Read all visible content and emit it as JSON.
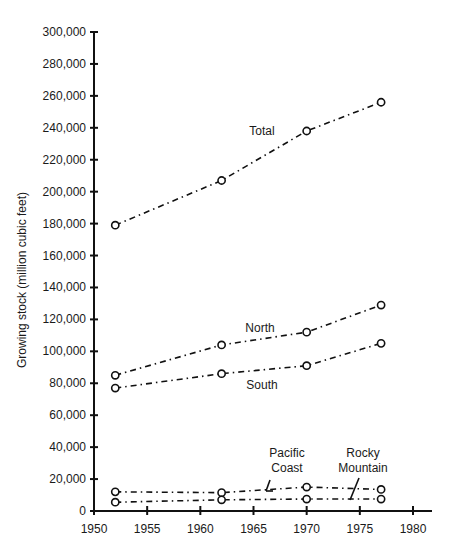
{
  "chart_data": {
    "type": "line",
    "title": "",
    "xlabel": "",
    "ylabel": "Growing stock (million cubic feet)",
    "xlim": [
      1950,
      1980
    ],
    "ylim": [
      0,
      300000
    ],
    "x_ticks": [
      1950,
      1955,
      1960,
      1965,
      1970,
      1975,
      1980
    ],
    "x_tick_labels": [
      "1950",
      "1955",
      "1960",
      "1965",
      "1970",
      "1975",
      "1980"
    ],
    "y_ticks": [
      0,
      20000,
      40000,
      60000,
      80000,
      100000,
      120000,
      140000,
      160000,
      180000,
      200000,
      220000,
      240000,
      260000,
      280000,
      300000
    ],
    "y_tick_labels": [
      "0",
      "20,000",
      "40,000",
      "60,000",
      "80,000",
      "100,000",
      "120,000",
      "140,000",
      "160,000",
      "180,000",
      "200,000",
      "220,000",
      "240,000",
      "260,000",
      "280,000",
      "300,000"
    ],
    "grid": false,
    "legend": "none (direct labels)",
    "x": [
      1952,
      1962,
      1970,
      1977
    ],
    "series": [
      {
        "name": "Total",
        "label": "Total",
        "values": [
          179000,
          207000,
          238000,
          256000
        ]
      },
      {
        "name": "North",
        "label": "North",
        "values": [
          85000,
          104000,
          112000,
          129000
        ]
      },
      {
        "name": "South",
        "label": "South",
        "values": [
          77000,
          86000,
          91000,
          105000
        ]
      },
      {
        "name": "Pacific Coast",
        "label_lines": [
          "Pacific",
          "Coast"
        ],
        "values": [
          12000,
          11500,
          15000,
          13500
        ]
      },
      {
        "name": "Rocky Mountain",
        "label_lines": [
          "Rocky",
          "Mountain"
        ],
        "values": [
          5500,
          7000,
          7500,
          7500
        ]
      }
    ],
    "line_style": "dash-dot",
    "marker": "open-circle",
    "color": "#111111"
  }
}
